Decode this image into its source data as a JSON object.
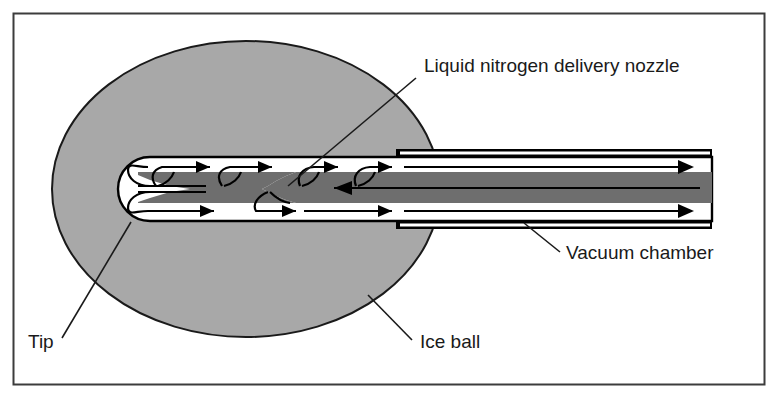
{
  "figure": {
    "type": "technical-diagram",
    "frame": {
      "x": 13,
      "y": 13,
      "width": 752,
      "height": 372,
      "border_color": "#3c3c3c"
    },
    "background_color": "#ffffff"
  },
  "colors": {
    "ice_ball_fill": "#a8a8a8",
    "ice_ball_stroke": "#1a1a1a",
    "core_fill": "#6e6e6e",
    "channel_fill": "#ffffff",
    "outline": "#000000",
    "label_text": "#1a1a1a",
    "leader_line": "#1a1a1a"
  },
  "labels": [
    {
      "id": "liquid-nitrogen-delivery-nozzle",
      "text": "Liquid nitrogen delivery nozzle",
      "x": 424,
      "y": 72,
      "leader": {
        "x1": 416,
        "y1": 78,
        "x2": 288,
        "y2": 186
      }
    },
    {
      "id": "vacuum-chamber",
      "text": "Vacuum chamber",
      "x": 566,
      "y": 259,
      "leader": {
        "x1": 560,
        "y1": 252,
        "x2": 524,
        "y2": 223
      }
    },
    {
      "id": "tip",
      "text": "Tip",
      "x": 28,
      "y": 348,
      "leader": {
        "x1": 62,
        "y1": 338,
        "x2": 131,
        "y2": 222
      }
    },
    {
      "id": "ice-ball",
      "text": "Ice ball",
      "x": 420,
      "y": 348,
      "leader": {
        "x1": 412,
        "y1": 340,
        "x2": 368,
        "y2": 295
      }
    }
  ],
  "ice_ball": {
    "cx": 246,
    "cy": 189,
    "rx": 194,
    "ry": 148
  },
  "probe": {
    "tip_left_x": 116,
    "shaft_right_x": 712,
    "channel_top_y": 157,
    "channel_bottom_y": 221,
    "core_top_y": 172,
    "core_bottom_y": 203,
    "core_left_x": 138,
    "wall_start_x": 396
  },
  "flow": {
    "outward_label": "nitrogen vapor return",
    "inward_label": "liquid nitrogen supply",
    "arrow_color": "#000000"
  }
}
